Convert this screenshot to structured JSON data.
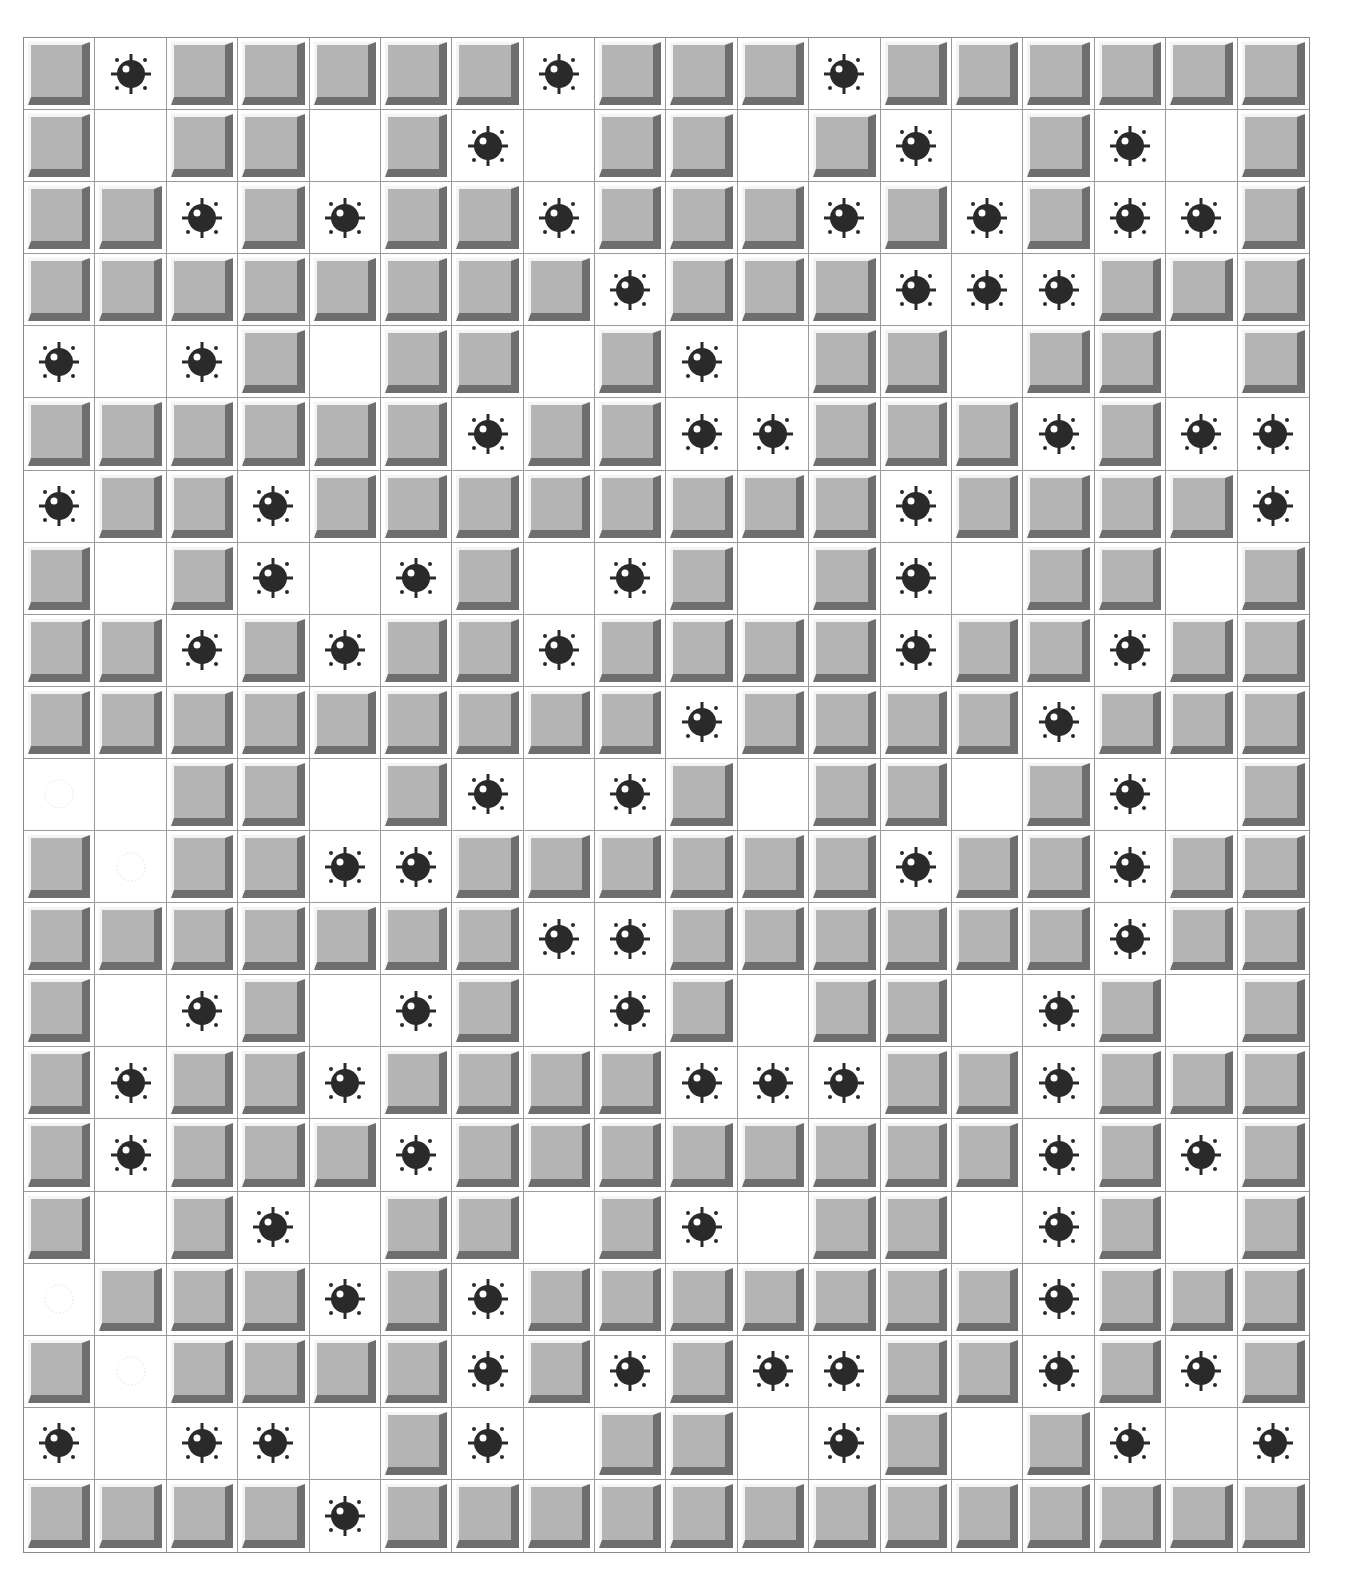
{
  "game": {
    "title": "Minesweeper",
    "columns": 18,
    "rows": 21,
    "legend": {
      "U": "unrevealed",
      "E": "revealed-empty",
      "M": "revealed-mine",
      "G": "revealed-empty-ghost-mine"
    },
    "colors": {
      "tile_face": "#b4b4b4",
      "tile_highlight": "#f4f4f4",
      "tile_shadow": "#6e6e6e",
      "revealed_bg": "#ffffff",
      "mine": "#2a2a2a",
      "grid_line": "#9a9a9a"
    },
    "board": [
      "UMUUUUUMUUUMUUUUUU",
      "UEUUEUMEUUEUMEUMEU",
      "UUMUMUUMUUUMUMUMMU",
      "UUUUUUUUMUUUMMMUUU",
      "MEMUEUUEUMEUUEUUEU",
      "UUUUUUMUUMMUUUMUMM",
      "MUUMUUUUUUUUMUUUUM",
      "UEUMEMUEMUEUMEUUEU",
      "UUMUMUUMUUUUMUUMUU",
      "UUUUUUUUUMUUUUMUUU",
      "GEUUEUMEMUEUUEUMEU",
      "UGUUMMUUUUUUMUUMUU",
      "UUUUUUUMMUUUUUUMUU",
      "UEMUEMUEMUEUUEMUEU",
      "UMUUMUUUUMMMUUMUUU",
      "UMUUUMUUUUUUUUMUMU",
      "UEUMEUUEUMEUUEMUEU",
      "GUUUMUMUUUUUUUMUUU",
      "UGUUUUMUMUMMUUMUMU",
      "MEMMEUMEUUEMUEUMEM",
      "UUUUMUUUUUUUUUUUUU"
    ]
  }
}
